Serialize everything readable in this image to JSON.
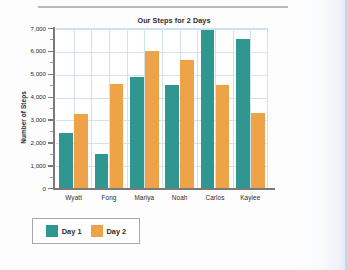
{
  "chart_data": {
    "type": "bar",
    "title": "Our Steps for 2 Days",
    "xlabel": "",
    "ylabel": "Number of Steps",
    "categories": [
      "Wyatt",
      "Fong",
      "Mariya",
      "Noah",
      "Carlos",
      "Kaylee"
    ],
    "series": [
      {
        "name": "Day 1",
        "color": "#309790",
        "values": [
          2400,
          1500,
          4850,
          4500,
          6920,
          6520
        ]
      },
      {
        "name": "Day 2",
        "color": "#efa348",
        "values": [
          3250,
          4550,
          6000,
          5580,
          4520,
          3300
        ]
      }
    ],
    "ylim": [
      0,
      7000
    ],
    "ytick_labels": [
      "0",
      "1,000",
      "2,000",
      "3,000",
      "4,000",
      "5,000",
      "6,000",
      "7,000"
    ],
    "ytick_values": [
      0,
      1000,
      2000,
      3000,
      4000,
      5000,
      6000,
      7000
    ],
    "grid": true,
    "grid_color": "#cfe2ee",
    "legend_position": "bottom-left"
  },
  "legend": {
    "items": [
      {
        "label": "Day 1"
      },
      {
        "label": "Day 2"
      }
    ]
  }
}
